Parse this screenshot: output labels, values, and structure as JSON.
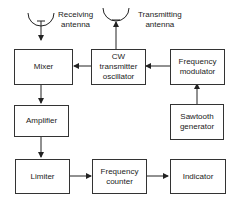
{
  "blocks": {
    "mixer": "Mixer",
    "cw_osc": [
      "CW",
      "transmitter",
      "oscillator"
    ],
    "freq_mod": [
      "Frequency",
      "modulator"
    ],
    "amplifier": "Amplifier",
    "sawtooth": [
      "Sawtooth",
      "generator"
    ],
    "limiter": "Limiter",
    "freq_counter": [
      "Frequency",
      "counter"
    ],
    "indicator": "Indicator"
  },
  "antennas": {
    "receiving": [
      "Receiving",
      "antenna"
    ],
    "transmitting": [
      "Transmitting",
      "antenna"
    ]
  }
}
